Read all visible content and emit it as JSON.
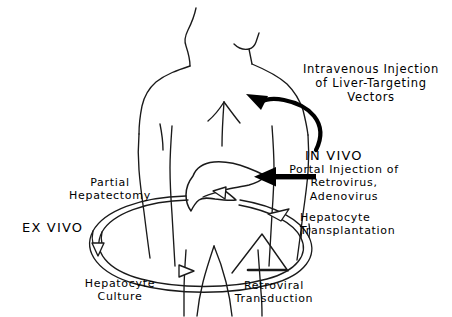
{
  "figure": {
    "width": 452,
    "height": 317,
    "background_color": "#ffffff",
    "line_color": "#000000"
  },
  "labels": {
    "intravenous_injection": "Intravenous Injection\nof Liver-Targeting\nVectors",
    "in_vivo": "IN VIVO",
    "portal_injection": "Portal Injection of\nRetrovirus,\nAdenovirus",
    "hepatocyte_transplantation": "Hepatocyte\nTransplantation",
    "partial_hepatectomy": "Partial\nHepatectomy",
    "ex_vivo": "EX VIVO",
    "hepatocyte_culture": "Hepatocyte\nCulture",
    "retroviral_transduction": "Retroviral\nTransduction"
  },
  "graphics": {
    "torso_outline": "human upper-body back-view outline with head, neck, shoulders, arms and legs",
    "liver_organ": "liver silhouette positioned at mid-torso",
    "intravenous_arrow": "bold solid S-curved arrow pointing left into the shoulder region",
    "portal_arrow": "bold solid horizontal arrow pointing left into the liver",
    "ex_vivo_cycle": "large double-line elliptical loop running counterclockwise around the lower torso",
    "culture_flask": "triangular culture vessel at the bottom center of the cycle",
    "cycle_arrowheads": [
      "hollow arrowhead pointing down on the left of the loop",
      "hollow arrowhead pointing right at the bottom left of the loop",
      "hollow arrowhead pointing up-right on the right of the loop",
      "hollow arrowhead pointing left into the liver at the top of the loop"
    ]
  }
}
